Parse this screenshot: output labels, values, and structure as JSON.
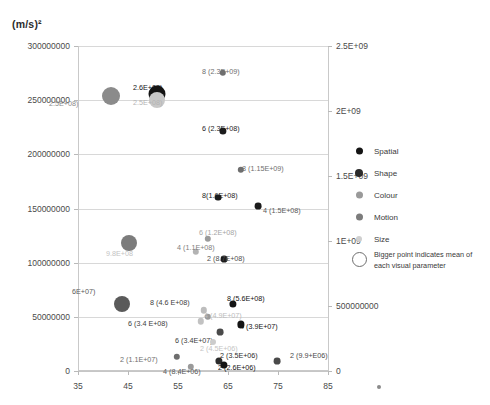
{
  "chart_data": {
    "type": "scatter",
    "title": "",
    "ylabel": "(m/s)²",
    "xlabel": "",
    "xlim": [
      35,
      85
    ],
    "ylim": [
      0,
      300000000
    ],
    "y2lim": [
      0,
      2500000000
    ],
    "grid": true,
    "legend_position": "right",
    "xticks": [
      "35",
      "45",
      "55",
      "65",
      "75",
      "85"
    ],
    "xtick_values": [
      35,
      45,
      55,
      65,
      75,
      85
    ],
    "yticks_left": [
      "0",
      "50000000",
      "100000000",
      "150000000",
      "200000000",
      "250000000",
      "300000000"
    ],
    "ytick_left_values": [
      0,
      50000000,
      100000000,
      150000000,
      200000000,
      250000000,
      300000000
    ],
    "yticks_right": [
      "0",
      "500000000",
      "1E+09",
      "1.5E+09",
      "2E+09",
      "2.5E+09"
    ],
    "ytick_right_values": [
      0,
      500000000,
      1000000000,
      1500000000,
      2000000000,
      2500000000
    ],
    "series": [
      {
        "name": "Spatial",
        "color": "#1a1a1a"
      },
      {
        "name": "Shape",
        "color": "#2e2e2e"
      },
      {
        "name": "Colour",
        "color": "#8f8f8f"
      },
      {
        "name": "Motion",
        "color": "#6a6a6a"
      },
      {
        "name": "Size",
        "color": "#cfcfcf"
      }
    ],
    "points": [
      {
        "id": "mean-colour",
        "series": "Colour",
        "x": 41.6,
        "y": 254000000,
        "r": 9,
        "mean": true,
        "color": "#8b8b8b",
        "label": "2.5E+08)",
        "lx": 49,
        "ly": 100,
        "lcolor": "#8b8b8b"
      },
      {
        "id": "mean-spatial",
        "series": "Spatial",
        "x": 50.8,
        "y": 256000000,
        "r": 8.5,
        "mean": true,
        "color": "#141414",
        "label": "2.6E+08)",
        "lx": 133,
        "ly": 84,
        "lcolor": "#141414"
      },
      {
        "id": "mean-size",
        "series": "Size",
        "x": 50.8,
        "y": 250000000,
        "r": 8,
        "mean": true,
        "color": "#c8c8c8",
        "label": "2.5E+08)",
        "lx": 133,
        "ly": 99,
        "lcolor": "#b4b4b4"
      },
      {
        "id": "p-8-23e9",
        "series": "Motion",
        "x": 64.0,
        "y": 275000000,
        "r": 3.2,
        "mean": false,
        "color": "#6e6e6e",
        "label": "8 (2.3E+09)",
        "lx": 202,
        "ly": 68,
        "lcolor": "#6e6e6e"
      },
      {
        "id": "p-6-23e8",
        "series": "Spatial",
        "x": 64.0,
        "y": 222000000,
        "r": 3.6,
        "mean": false,
        "color": "#1c1c1c",
        "label": "6 (2.3E+08)",
        "lx": 202,
        "ly": 125,
        "lcolor": "#1c1c1c"
      },
      {
        "id": "p-8-115e9",
        "series": "Motion",
        "x": 67.6,
        "y": 186000000,
        "r": 3.2,
        "mean": false,
        "color": "#6e6e6e",
        "label": "8 (1.15E+09)",
        "lx": 242,
        "ly": 165,
        "lcolor": "#6e6e6e"
      },
      {
        "id": "p-8-16e8",
        "series": "Spatial",
        "x": 63.0,
        "y": 160000000,
        "r": 3.4,
        "mean": false,
        "color": "#1c1c1c",
        "label": "8(1.6E+08)",
        "lx": 202,
        "ly": 192,
        "lcolor": "#1c1c1c"
      },
      {
        "id": "p-4-15e8",
        "series": "Spatial",
        "x": 71.0,
        "y": 152000000,
        "r": 3.4,
        "mean": false,
        "color": "#1c1c1c",
        "label": "4 (1.5E+08)",
        "lx": 263,
        "ly": 207,
        "lcolor": "#5a5a5a"
      },
      {
        "id": "p-6-12e8",
        "series": "Colour",
        "x": 61.0,
        "y": 122000000,
        "r": 3.2,
        "mean": false,
        "color": "#9a9a9a",
        "label": "6 (1.2E+08)",
        "lx": 199,
        "ly": 229,
        "lcolor": "#a5a5a5"
      },
      {
        "id": "mean-motion",
        "series": "Motion",
        "x": 45.2,
        "y": 118000000,
        "r": 8,
        "mean": true,
        "color": "#7c7c7c",
        "label": "9.8E+08",
        "lx": 106,
        "ly": 250,
        "lcolor": "#c3c3c3"
      },
      {
        "id": "p-4-11e8",
        "series": "Size",
        "x": 58.5,
        "y": 110000000,
        "r": 3.2,
        "mean": false,
        "color": "#b3b3b3",
        "label": "4 (1.1E+08)",
        "lx": 177,
        "ly": 244,
        "lcolor": "#7e7e7e"
      },
      {
        "id": "p-2-87e8",
        "series": "Spatial",
        "x": 64.2,
        "y": 103000000,
        "r": 3.4,
        "mean": false,
        "color": "#1c1c1c",
        "label": "2 (8.7E+08)",
        "lx": 207,
        "ly": 255,
        "lcolor": "#4f4f4f"
      },
      {
        "id": "mean-shape",
        "series": "Shape",
        "x": 43.8,
        "y": 62000000,
        "r": 8,
        "mean": true,
        "color": "#5a5a5a",
        "label": "6E+07)",
        "lx": 72,
        "ly": 288,
        "lcolor": "#5a5a5a"
      },
      {
        "id": "p-8-46e8",
        "series": "Size",
        "x": 60.2,
        "y": 56000000,
        "r": 3.2,
        "mean": false,
        "color": "#bdbdbd",
        "label": "8 (4.6 E+08)",
        "lx": 150,
        "ly": 299,
        "lcolor": "#3d3d3d"
      },
      {
        "id": "p-8-56e8",
        "series": "Spatial",
        "x": 66.0,
        "y": 62000000,
        "r": 3.6,
        "mean": false,
        "color": "#141414",
        "label": "8 (5.6E+08)",
        "lx": 227,
        "ly": 295,
        "lcolor": "#141414"
      },
      {
        "id": "p-4-49e7",
        "series": "Colour",
        "x": 61.0,
        "y": 50000000,
        "r": 3.2,
        "mean": false,
        "color": "#9a9a9a",
        "label": "4 (4.9E+07)",
        "lx": 204,
        "ly": 312,
        "lcolor": "#bcbcbc"
      },
      {
        "id": "p-6-34e8",
        "series": "Size",
        "x": 59.6,
        "y": 46000000,
        "r": 3.2,
        "mean": false,
        "color": "#c2c2c2",
        "label": "6 (3.4 E+08)",
        "lx": 128,
        "ly": 320,
        "lcolor": "#3d3d3d"
      },
      {
        "id": "p-4-39e7",
        "series": "Spatial",
        "x": 67.5,
        "y": 43000000,
        "r": 3.6,
        "mean": false,
        "color": "#141414",
        "label": "4 (3.9E+07)",
        "lx": 240,
        "ly": 323,
        "lcolor": "#141414"
      },
      {
        "id": "p-6-34e7",
        "series": "Motion",
        "x": 63.4,
        "y": 36000000,
        "r": 3.4,
        "mean": false,
        "color": "#4a4a4a",
        "label": "6 (3.4E+07)",
        "lx": 175,
        "ly": 337,
        "lcolor": "#3d3d3d"
      },
      {
        "id": "p-2-45e6",
        "series": "Size",
        "x": 62.0,
        "y": 27000000,
        "r": 3.0,
        "mean": false,
        "color": "#cccccc",
        "label": "2 (4.5E+06)",
        "lx": 200,
        "ly": 345,
        "lcolor": "#c4c4c4"
      },
      {
        "id": "p-2-11e7",
        "series": "Motion",
        "x": 54.8,
        "y": 13000000,
        "r": 3.2,
        "mean": false,
        "color": "#6e6e6e",
        "label": "2 (1.1E+07)",
        "lx": 120,
        "ly": 356,
        "lcolor": "#6e6e6e"
      },
      {
        "id": "p-2-35e6",
        "series": "Shape",
        "x": 63.2,
        "y": 9000000,
        "r": 3.6,
        "mean": false,
        "color": "#2b2b2b",
        "label": "2 (3.5E+06)",
        "lx": 220,
        "ly": 352,
        "lcolor": "#2b2b2b"
      },
      {
        "id": "p-2-26e6",
        "series": "Spatial",
        "x": 64.2,
        "y": 6000000,
        "r": 3.6,
        "mean": false,
        "color": "#141414",
        "label": "2 (2.6E+06)",
        "lx": 218,
        "ly": 364,
        "lcolor": "#141414"
      },
      {
        "id": "p-4-84e6",
        "series": "Colour",
        "x": 57.6,
        "y": 4000000,
        "r": 3.2,
        "mean": false,
        "color": "#9a9a9a",
        "label": "4 (8.4E+06)",
        "lx": 163,
        "ly": 368,
        "lcolor": "#5a5a5a"
      },
      {
        "id": "p-2-99e6",
        "series": "Motion",
        "x": 74.8,
        "y": 9500000,
        "r": 3.4,
        "mean": false,
        "color": "#4a4a4a",
        "label": "2 (9.9+E06)",
        "lx": 290,
        "ly": 352,
        "lcolor": "#4a4a4a"
      }
    ],
    "legend_entries": [
      {
        "label": "Spatial",
        "color": "#141414",
        "size": 7
      },
      {
        "label": "Shape",
        "color": "#2b2b2b",
        "size": 8
      },
      {
        "label": "Colour",
        "color": "#9a9a9a",
        "size": 7
      },
      {
        "label": "Motion",
        "color": "#7c7c7c",
        "size": 7
      },
      {
        "label": "Size",
        "color": "#cfcfcf",
        "size": 6
      }
    ],
    "legend_note": "Bigger point indicates mean of each visual parameter"
  }
}
